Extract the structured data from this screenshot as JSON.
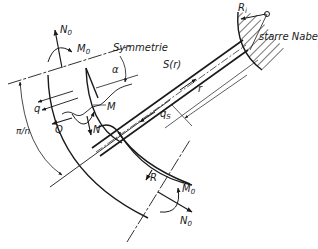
{
  "diagram": {
    "colors": {
      "ink": "#1a1a1a",
      "background": "#ffffff"
    },
    "labels": {
      "N0_top": "N",
      "N0_top_sub": "0",
      "M0_top": "M",
      "M0_top_sub": "0",
      "symmetrie": "Symmetrie",
      "alpha": "α",
      "q": "q",
      "Q": "Q",
      "M": "M",
      "N": "N",
      "pi_n": "π/n",
      "S_r": "S(r)",
      "q_s": "q",
      "q_s_sub": "S",
      "r": "r",
      "R_i": "R",
      "R_i_sub": "i",
      "starre_nabe": "starre Nabe",
      "R": "R",
      "M0_bottom": "M",
      "M0_bottom_sub": "0",
      "N0_bottom": "N",
      "N0_bottom_sub": "0"
    }
  }
}
